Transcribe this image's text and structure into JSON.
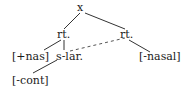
{
  "diagram": {
    "type": "feature-geometry-tree",
    "nodes": {
      "root": "x",
      "root_left": "rt.",
      "root_right": "rt.",
      "nas_feature": "[+nas]",
      "slar": "s-lar.",
      "cont_feature": "[-cont]",
      "nasal_feature": "[-nasal]"
    },
    "edges": [
      {
        "from": "x",
        "to": "rt. (left)",
        "style": "solid"
      },
      {
        "from": "x",
        "to": "rt. (right)",
        "style": "solid"
      },
      {
        "from": "rt. (left)",
        "to": "[+nas]",
        "style": "solid"
      },
      {
        "from": "rt. (left)",
        "to": "s-lar.",
        "style": "solid"
      },
      {
        "from": "rt. (right)",
        "to": "[-nasal]",
        "style": "solid"
      },
      {
        "from": "s-lar.",
        "to": "[-cont]",
        "style": "solid"
      },
      {
        "from": "s-lar.",
        "to": "rt. (right)",
        "style": "dashed"
      }
    ],
    "line_color": "#333333"
  }
}
